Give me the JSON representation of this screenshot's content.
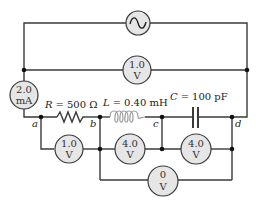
{
  "diagram": {
    "type": "circuit",
    "source": {
      "symbol": "ac-source",
      "glyph": "~"
    },
    "components": {
      "resistor": {
        "symbol": "R",
        "eq": "=",
        "value": "500 Ω"
      },
      "inductor": {
        "symbol": "L",
        "eq": "=",
        "value": "0.40 mH"
      },
      "capacitor": {
        "symbol": "C",
        "eq": "=",
        "value": "100 pF"
      }
    },
    "nodes": {
      "a": "a",
      "b": "b",
      "c": "c",
      "d": "d"
    },
    "meters": {
      "ammeter": {
        "line1": "2.0",
        "line2": "mA"
      },
      "v_source": {
        "line1": "1.0",
        "line2": "V"
      },
      "v_ab": {
        "line1": "1.0",
        "line2": "V"
      },
      "v_bc": {
        "line1": "4.0",
        "line2": "V"
      },
      "v_cd": {
        "line1": "4.0",
        "line2": "V"
      },
      "v_bd": {
        "line1": "0",
        "line2": "V"
      }
    },
    "colors": {
      "wire": "#3a3a3a",
      "meter_fill": "#e6e6e6",
      "inductor": "#9a9a9a"
    }
  }
}
